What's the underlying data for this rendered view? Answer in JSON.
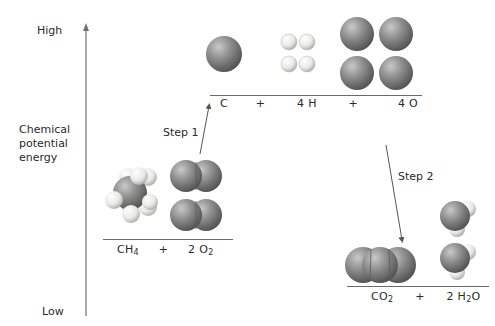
{
  "axis": {
    "title_lines": [
      "Chemical",
      "potential",
      "energy"
    ],
    "high_label": "High",
    "low_label": "Low"
  },
  "steps": {
    "step1": "Step 1",
    "step2": "Step 2"
  },
  "levels": {
    "reactants": {
      "terms": [
        {
          "base": "CH",
          "sub": "4"
        },
        {
          "sep": "+"
        },
        {
          "coef": "2 ",
          "base": "O",
          "sub": "2"
        }
      ]
    },
    "atoms": {
      "terms": [
        {
          "base": "C"
        },
        {
          "sep": "+"
        },
        {
          "base": "4 H"
        },
        {
          "sep": "+"
        },
        {
          "base": "4 O"
        }
      ]
    },
    "products": {
      "terms": [
        {
          "base": "CO",
          "sub": "2"
        },
        {
          "sep": "+"
        },
        {
          "coef": "2 ",
          "base": "H",
          "sub": "2",
          "tail": "O"
        }
      ]
    }
  },
  "colors": {
    "carbon_oxygen": "#7a7a7a",
    "hydrogen": "#e6e6e2",
    "axis": "#707070",
    "arrow": "#555555"
  }
}
